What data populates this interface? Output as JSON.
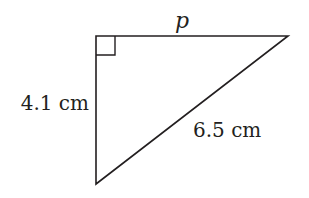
{
  "diagram": {
    "type": "right-triangle",
    "colors": {
      "stroke": "#231f20",
      "background": "#ffffff"
    },
    "vertices": {
      "right_angle": {
        "x": 96,
        "y": 36
      },
      "top_right": {
        "x": 288,
        "y": 36
      },
      "bottom": {
        "x": 96,
        "y": 184
      }
    },
    "right_angle_marker_size": 19,
    "labels": {
      "top_side": "p",
      "left_side": "4.1 cm",
      "hypotenuse": "6.5 cm"
    }
  }
}
